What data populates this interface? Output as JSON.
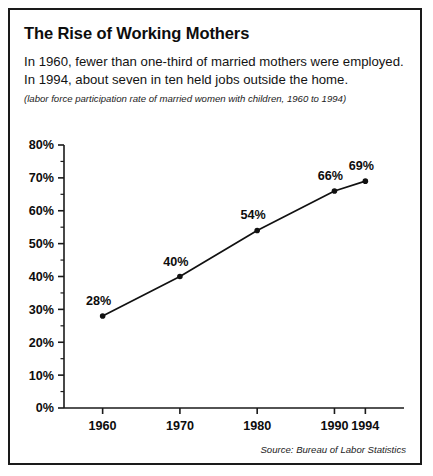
{
  "card": {
    "title": "The Rise of Working Mothers",
    "description": "In 1960, fewer than one-third of married mothers were employed. In 1994, about seven in ten held jobs outside the home.",
    "subtitle": "(labor force participation rate of married women with children, 1960 to 1994)",
    "source": "Source: Bureau of Labor Statistics",
    "border_color": "#1a1a1a",
    "background_color": "#ffffff",
    "text_color": "#101010"
  },
  "chart_data": {
    "type": "line",
    "title": "The Rise of Working Mothers",
    "subtitle": "(labor force participation rate of married women with children, 1960 to 1994)",
    "xlabel": "",
    "ylabel": "",
    "categories": [
      "1960",
      "1970",
      "1980",
      "1990",
      "1994"
    ],
    "x": [
      1960,
      1970,
      1980,
      1990,
      1994
    ],
    "values": [
      28,
      40,
      54,
      66,
      69
    ],
    "point_labels": [
      "28%",
      "40%",
      "54%",
      "66%",
      "69%"
    ],
    "xtick_labels": [
      "1960",
      "1970",
      "1980",
      "1990",
      "1994"
    ],
    "ytick_labels": [
      "0%",
      "10%",
      "20%",
      "30%",
      "40%",
      "50%",
      "60%",
      "70%",
      "80%"
    ],
    "ytick_values": [
      0,
      10,
      20,
      30,
      40,
      50,
      60,
      70,
      80
    ],
    "yminor_step": 5,
    "ylim": [
      0,
      80
    ],
    "xlim": [
      1955,
      1999
    ],
    "grid": false,
    "legend": false,
    "series_color": "#111111",
    "marker": "circle",
    "source": "Source: Bureau of Labor Statistics"
  }
}
